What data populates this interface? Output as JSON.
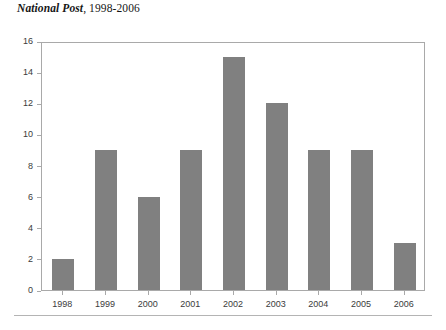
{
  "title": {
    "publication": "National Post",
    "range": ", 1998-2006",
    "full": "National Post, 1998-2006"
  },
  "colors": {
    "bar": "#808080",
    "axis": "#a9a9a9",
    "text": "#3b3b3b",
    "title_text": "#161616",
    "rule": "#b4b4b4",
    "background": "#ffffff"
  },
  "chart_data": {
    "type": "bar",
    "title": "National Post, 1998-2006",
    "xlabel": "",
    "ylabel": "",
    "categories": [
      "1998",
      "1999",
      "2000",
      "2001",
      "2002",
      "2003",
      "2004",
      "2005",
      "2006"
    ],
    "values": [
      2,
      9,
      6,
      9,
      15,
      12,
      9,
      9,
      3
    ],
    "ylim": [
      0,
      16
    ],
    "ytick_labels": [
      "0",
      "2",
      "4",
      "6",
      "8",
      "10",
      "12",
      "14",
      "16"
    ],
    "ytick_values": [
      0,
      2,
      4,
      6,
      8,
      10,
      12,
      14,
      16
    ],
    "grid": false,
    "legend": null,
    "legend_position": "none",
    "series": [
      {
        "name": "Articles",
        "values": [
          2,
          9,
          6,
          9,
          15,
          12,
          9,
          9,
          3
        ]
      }
    ]
  }
}
